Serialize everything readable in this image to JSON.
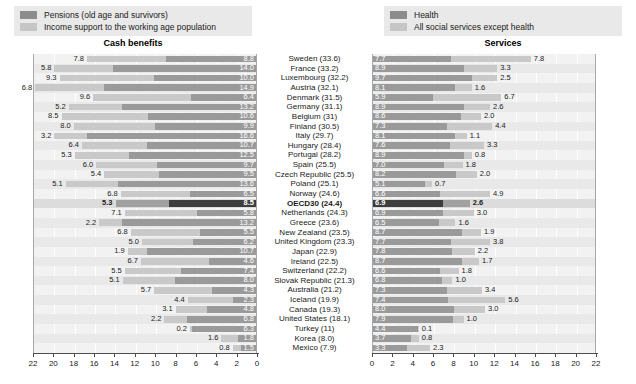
{
  "legends": {
    "left": [
      {
        "key": "pensions",
        "label": "Pensions (old age and survivors)",
        "color": "#8c8c8c"
      },
      {
        "key": "income_support",
        "label": "Income support to the working age population",
        "color": "#c6c6c6"
      }
    ],
    "right": [
      {
        "key": "health",
        "label": "Health",
        "color": "#8c8c8c"
      },
      {
        "key": "other_services",
        "label": "All social services except health",
        "color": "#c6c6c6"
      }
    ]
  },
  "panels": {
    "left_title": "Cash benefits",
    "right_title": "Services"
  },
  "chart_data": {
    "type": "bar",
    "orientation": "horizontal",
    "layout": "back-to-back stacked bars (two panels sharing centred category labels)",
    "grid": true,
    "legend_position": "top",
    "panels": [
      {
        "name": "left",
        "title": "Cash benefits",
        "xlabel": "",
        "ylabel": "",
        "xlim": [
          22,
          0
        ],
        "direction": "right-to-left",
        "ticks": [
          22,
          20,
          18,
          16,
          14,
          12,
          10,
          8,
          6,
          4,
          2,
          0
        ],
        "series": [
          {
            "name": "Pensions (old age and survivors)",
            "color": "#9a9a9a"
          },
          {
            "name": "Income support to the working age population",
            "color": "#c9c9c9"
          }
        ]
      },
      {
        "name": "right",
        "title": "Services",
        "xlabel": "",
        "ylabel": "",
        "xlim": [
          0,
          22
        ],
        "direction": "left-to-right",
        "ticks": [
          0,
          2,
          4,
          6,
          8,
          10,
          12,
          14,
          16,
          18,
          20,
          22
        ],
        "series": [
          {
            "name": "Health",
            "color": "#9a9a9a"
          },
          {
            "name": "All social services except health",
            "color": "#c9c9c9"
          }
        ]
      }
    ],
    "categories": [
      "Sweden (33.6)",
      "France (33.2)",
      "Luxembourg (32.2)",
      "Austria (32.1)",
      "Denmark (31.5)",
      "Germany (31.1)",
      "Belgium (31)",
      "Finland (30.5)",
      "Italy (29.7)",
      "Hungary (28.4)",
      "Portugal (28.2)",
      "Spain (25.5)",
      "Czech Republic (25.5)",
      "Poland (25.1)",
      "Norway (24.6)",
      "OECD30 (24.4)",
      "Netherlands (24.3)",
      "Greece (23.6)",
      "New Zealand (23.5)",
      "United Kingdom (23.3)",
      "Japan (22.9)",
      "Ireland (22.5)",
      "Switzerland (22.2)",
      "Slovak Republic (21.3)",
      "Australia (21.2)",
      "Iceland (19.9)",
      "Canada (19.3)",
      "United States (18.1)",
      "Turkey (11)",
      "Korea (8.0)",
      "Mexico (7.9)"
    ],
    "highlight_category": "OECD30 (24.4)",
    "rows": [
      {
        "country": "Sweden (33.6)",
        "cash_pensions": 8.8,
        "cash_income_support": 7.8,
        "serv_health": 7.7,
        "serv_other": 7.8
      },
      {
        "country": "France (33.2)",
        "cash_pensions": 14.0,
        "cash_income_support": 5.8,
        "serv_health": 8.9,
        "serv_other": 3.3
      },
      {
        "country": "Luxembourg (32.2)",
        "cash_pensions": 10.0,
        "cash_income_support": 9.3,
        "serv_health": 9.7,
        "serv_other": 2.5
      },
      {
        "country": "Austria (32.1)",
        "cash_pensions": 14.9,
        "cash_income_support": 6.8,
        "serv_health": 8.1,
        "serv_other": 1.6
      },
      {
        "country": "Denmark (31.5)",
        "cash_pensions": 6.4,
        "cash_income_support": 9.6,
        "serv_health": 5.9,
        "serv_other": 6.7
      },
      {
        "country": "Germany (31.1)",
        "cash_pensions": 13.2,
        "cash_income_support": 5.2,
        "serv_health": 8.9,
        "serv_other": 2.6
      },
      {
        "country": "Belgium (31)",
        "cash_pensions": 10.6,
        "cash_income_support": 8.5,
        "serv_health": 8.6,
        "serv_other": 2.0
      },
      {
        "country": "Finland (30.5)",
        "cash_pensions": 9.9,
        "cash_income_support": 8.0,
        "serv_health": 7.3,
        "serv_other": 4.4
      },
      {
        "country": "Italy (29.7)",
        "cash_pensions": 16.6,
        "cash_income_support": 3.2,
        "serv_health": 8.1,
        "serv_other": 1.1
      },
      {
        "country": "Hungary (28.4)",
        "cash_pensions": 10.7,
        "cash_income_support": 6.4,
        "serv_health": 7.6,
        "serv_other": 3.3
      },
      {
        "country": "Portugal (28.2)",
        "cash_pensions": 12.5,
        "cash_income_support": 5.3,
        "serv_health": 8.9,
        "serv_other": 0.8
      },
      {
        "country": "Spain (25.5)",
        "cash_pensions": 9.7,
        "cash_income_support": 6.0,
        "serv_health": 7.0,
        "serv_other": 1.8
      },
      {
        "country": "Czech Republic (25.5)",
        "cash_pensions": 9.5,
        "cash_income_support": 5.4,
        "serv_health": 8.2,
        "serv_other": 2.0
      },
      {
        "country": "Poland (25.1)",
        "cash_pensions": 13.6,
        "cash_income_support": 5.1,
        "serv_health": 5.1,
        "serv_other": 0.7
      },
      {
        "country": "Norway (24.6)",
        "cash_pensions": 6.5,
        "cash_income_support": 6.8,
        "serv_health": 6.6,
        "serv_other": 4.9
      },
      {
        "country": "OECD30 (24.4)",
        "cash_pensions": 8.5,
        "cash_income_support": 5.3,
        "serv_health": 6.9,
        "serv_other": 2.6
      },
      {
        "country": "Netherlands (24.3)",
        "cash_pensions": 5.8,
        "cash_income_support": 7.1,
        "serv_health": 6.9,
        "serv_other": 3.0
      },
      {
        "country": "Greece (23.6)",
        "cash_pensions": 13.2,
        "cash_income_support": 2.2,
        "serv_health": 6.5,
        "serv_other": 1.6
      },
      {
        "country": "New Zealand (23.5)",
        "cash_pensions": 5.5,
        "cash_income_support": 6.8,
        "serv_health": 8.7,
        "serv_other": 1.9
      },
      {
        "country": "United Kingdom (23.3)",
        "cash_pensions": 6.2,
        "cash_income_support": 5.0,
        "serv_health": 7.7,
        "serv_other": 3.8
      },
      {
        "country": "Japan (22.9)",
        "cash_pensions": 10.7,
        "cash_income_support": 1.9,
        "serv_health": 7.8,
        "serv_other": 2.2
      },
      {
        "country": "Ireland (22.5)",
        "cash_pensions": 4.6,
        "cash_income_support": 6.7,
        "serv_health": 8.7,
        "serv_other": 1.7
      },
      {
        "country": "Switzerland (22.2)",
        "cash_pensions": 7.4,
        "cash_income_support": 5.5,
        "serv_health": 6.6,
        "serv_other": 1.8
      },
      {
        "country": "Slovak Republic (21.3)",
        "cash_pensions": 8.0,
        "cash_income_support": 5.1,
        "serv_health": 6.8,
        "serv_other": 1.0
      },
      {
        "country": "Australia (21.2)",
        "cash_pensions": 4.3,
        "cash_income_support": 5.7,
        "serv_health": 7.3,
        "serv_other": 3.4
      },
      {
        "country": "Iceland (19.9)",
        "cash_pensions": 2.3,
        "cash_income_support": 4.4,
        "serv_health": 7.4,
        "serv_other": 5.6
      },
      {
        "country": "Canada (19.3)",
        "cash_pensions": 4.8,
        "cash_income_support": 3.1,
        "serv_health": 8.0,
        "serv_other": 3.0
      },
      {
        "country": "United States (18.1)",
        "cash_pensions": 6.8,
        "cash_income_support": 2.2,
        "serv_health": 7.9,
        "serv_other": 1.0
      },
      {
        "country": "Turkey (11)",
        "cash_pensions": 6.3,
        "cash_income_support": 0.2,
        "serv_health": 4.4,
        "serv_other": 0.1
      },
      {
        "country": "Korea (8.0)",
        "cash_pensions": 1.8,
        "cash_income_support": 1.6,
        "serv_health": 3.7,
        "serv_other": 0.8
      },
      {
        "country": "Mexico (7.9)",
        "cash_pensions": 1.5,
        "cash_income_support": 0.8,
        "serv_health": 3.3,
        "serv_other": 2.3
      }
    ]
  }
}
